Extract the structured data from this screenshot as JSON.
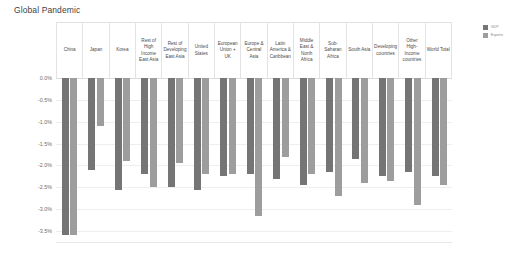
{
  "chart_data": {
    "type": "bar",
    "title": "Global Pandemic",
    "xlabel": "",
    "ylabel": "",
    "ylim": [
      -3.75,
      0.0
    ],
    "grid": true,
    "legend_position": "top-right",
    "ytick_labels": [
      "0.0%",
      "-0.5%",
      "-1.0%",
      "-1.5%",
      "-2.0%",
      "-2.5%",
      "-3.0%",
      "-3.5%"
    ],
    "ytick_values": [
      0.0,
      -0.5,
      -1.0,
      -1.5,
      -2.0,
      -2.5,
      -3.0,
      -3.5
    ],
    "categories": [
      "China",
      "Japan",
      "Korea",
      "Rest of High Income East Asia",
      "Rest of Developing East Asia",
      "United States",
      "European Union + UK",
      "Europe & Central Asia",
      "Latin America & Caribbean",
      "Middle East & North Africa",
      "Sub-Saharan Africa",
      "South Asia",
      "Developing countries",
      "Other High-Income countries",
      "World Total"
    ],
    "series": [
      {
        "name": "GDP",
        "color": "#757575",
        "values": [
          -3.6,
          -2.1,
          -2.55,
          -2.2,
          -2.5,
          -2.55,
          -2.25,
          -2.2,
          -2.3,
          -2.45,
          -2.15,
          -1.85,
          -2.25,
          -2.15,
          -2.25
        ]
      },
      {
        "name": "Exports",
        "color": "#9d9d9d",
        "values": [
          -3.6,
          -1.1,
          -1.9,
          -2.5,
          -1.95,
          -2.2,
          -2.2,
          -3.15,
          -1.8,
          -2.2,
          -2.7,
          -2.4,
          -2.35,
          -2.9,
          -2.45
        ]
      }
    ]
  },
  "legend": {
    "items": [
      {
        "label": "GDP",
        "color": "#757575"
      },
      {
        "label": "Exports",
        "color": "#9d9d9d"
      }
    ]
  }
}
